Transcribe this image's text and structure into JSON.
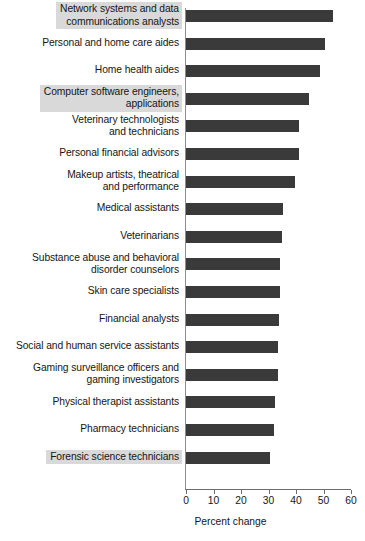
{
  "chart_data": {
    "type": "bar",
    "orientation": "horizontal",
    "title": "",
    "xlabel": "Percent change",
    "ylabel": "",
    "xlim": [
      0,
      60
    ],
    "xticks": [
      0,
      10,
      20,
      30,
      40,
      50,
      60
    ],
    "grid": false,
    "legend": null,
    "bar_color": "#3a3a3a",
    "highlight_color": "#d9d9d9",
    "categories": [
      "Network systems and data\ncommunications analysts",
      "Personal and home care aides",
      "Home health aides",
      "Computer software engineers,\napplications",
      "Veterinary technologists\nand technicians",
      "Personal financial advisors",
      "Makeup artists, theatrical\nand performance",
      "Medical assistants",
      "Veterinarians",
      "Substance abuse and behavioral\ndisorder counselors",
      "Skin care specialists",
      "Financial analysts",
      "Social and human service assistants",
      "Gaming surveillance officers and\ngaming investigators",
      "Physical therapist assistants",
      "Pharmacy technicians",
      "Forensic science technicians"
    ],
    "values": [
      53.4,
      50.6,
      48.7,
      44.6,
      41.0,
      41.0,
      39.8,
      35.4,
      35.0,
      34.3,
      34.3,
      33.8,
      33.6,
      33.6,
      32.4,
      32.0,
      30.7
    ],
    "highlighted": [
      true,
      false,
      false,
      true,
      false,
      false,
      false,
      false,
      false,
      false,
      false,
      false,
      false,
      false,
      false,
      false,
      true
    ]
  },
  "axis": {
    "xlabel": "Percent change",
    "ticks": [
      "0",
      "10",
      "20",
      "30",
      "40",
      "50",
      "60"
    ]
  }
}
